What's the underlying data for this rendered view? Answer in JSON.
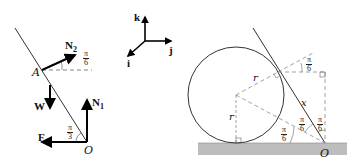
{
  "left_diagram": {
    "labels": {
      "N2": "N",
      "N2_sub": "2",
      "N1": "N",
      "N1_sub": "1",
      "W": "W",
      "F": "F",
      "A": "A",
      "O": "O"
    },
    "angles": {
      "top": {
        "num": "π",
        "den": "6"
      },
      "bottom": {
        "num": "π",
        "den": "3"
      }
    }
  },
  "axes_diagram": {
    "k": "k",
    "j": "j",
    "i": "i"
  },
  "right_diagram": {
    "labels": {
      "r_top": "r",
      "r_left": "r",
      "x": "x",
      "O": "O"
    },
    "angles": {
      "top": {
        "num": "π",
        "den": "6"
      },
      "mid": {
        "num": "π",
        "den": "6"
      },
      "right": {
        "num": "π",
        "den": "6"
      },
      "bottom": {
        "num": "π",
        "den": "6"
      }
    },
    "colors": {
      "ground": "#bdbdbd",
      "line": "#333333",
      "dashed": "#888888"
    }
  }
}
